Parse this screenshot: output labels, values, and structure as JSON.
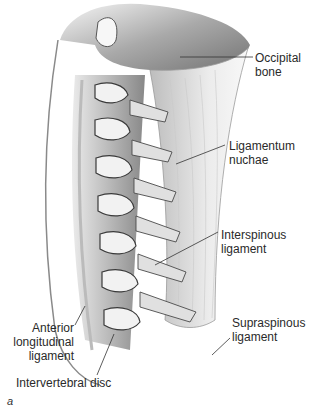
{
  "figure": {
    "panel_letter": "a",
    "colors": {
      "ink": "#2a2a2a",
      "shade_dark": "#3a3a3a",
      "shade_mid": "#8a8a8a",
      "shade_light": "#d8d8d8",
      "background": "#ffffff"
    },
    "labels": [
      {
        "id": "occipital-bone",
        "line1": "Occipital",
        "line2": "bone"
      },
      {
        "id": "ligamentum-nuchae",
        "line1": "Ligamentum",
        "line2": "nuchae"
      },
      {
        "id": "interspinous-ligament",
        "line1": "Interspinous",
        "line2": "ligament"
      },
      {
        "id": "supraspinous-ligament",
        "line1": "Supraspinous",
        "line2": "ligament"
      },
      {
        "id": "anterior-longitudinal-ligament",
        "line1": "Anterior",
        "line2": "longitudinal",
        "line3": "ligament"
      },
      {
        "id": "intervertebral-disc",
        "line1": "Intervertebral disc"
      }
    ]
  }
}
